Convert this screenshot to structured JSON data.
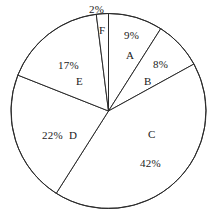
{
  "chart_data": {
    "type": "pie",
    "title": "",
    "subtitle": "",
    "xlabel": "",
    "ylabel": "",
    "legend_position": "none",
    "grid": false,
    "units": "percent",
    "total": 100,
    "categories": [
      "A",
      "B",
      "C",
      "D",
      "E",
      "F"
    ],
    "values": [
      9,
      8,
      42,
      22,
      17,
      2
    ],
    "labels": [
      "9%",
      "8%",
      "42%",
      "22%",
      "17%",
      "2%"
    ],
    "slices": [
      {
        "name": "A",
        "value": 9,
        "label": "9%",
        "letter": "A",
        "start_deg": 0,
        "end_deg": 32.4
      },
      {
        "name": "B",
        "value": 8,
        "label": "8%",
        "letter": "B",
        "start_deg": 32.4,
        "end_deg": 61.2
      },
      {
        "name": "C",
        "value": 42,
        "label": "42%",
        "letter": "C",
        "start_deg": 61.2,
        "end_deg": 212.4
      },
      {
        "name": "D",
        "value": 22,
        "label": "22%",
        "letter": "D",
        "start_deg": 212.4,
        "end_deg": 291.6
      },
      {
        "name": "E",
        "value": 17,
        "label": "17%",
        "letter": "E",
        "start_deg": 291.6,
        "end_deg": 352.8
      },
      {
        "name": "F",
        "value": 2,
        "label": "2%",
        "letter": "F",
        "start_deg": 352.8,
        "end_deg": 360
      }
    ],
    "colors": {
      "slice_fill": "#ffffff",
      "slice_stroke": "#2b2b2b",
      "text": "#1a1a1a",
      "background": "#ffffff"
    }
  },
  "annotations": {
    "pct_a": "9%",
    "letter_a": "A",
    "pct_b": "8%",
    "letter_b": "B",
    "letter_c": "C",
    "pct_c": "42%",
    "pct_d": "22%",
    "letter_d": "D",
    "pct_e": "17%",
    "letter_e": "E",
    "pct_f": "2%",
    "letter_f": "F"
  }
}
